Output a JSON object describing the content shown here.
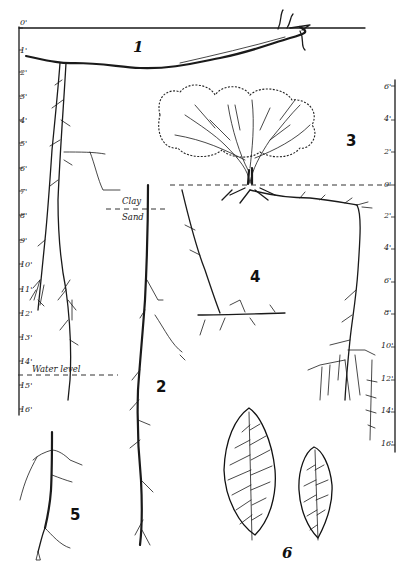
{
  "figure": {
    "type": "botanical root system diagram",
    "panels": [
      {
        "number": "1",
        "label": "1",
        "description": "horizontal root near surface"
      },
      {
        "number": "2",
        "label": "2",
        "description": "vertical taproot extending below water level"
      },
      {
        "number": "3",
        "label": "3",
        "description": "shrub with above-ground crown"
      },
      {
        "number": "4",
        "label": "4",
        "description": "lateral root system beneath shrub"
      },
      {
        "number": "5",
        "label": "5",
        "description": "detached root fragment"
      },
      {
        "number": "6",
        "label": "6",
        "description": "two leaves showing venation"
      }
    ],
    "left_scale": {
      "ticks": [
        "0'",
        "1'",
        "2'",
        "3'",
        "4'",
        "5'",
        "6'",
        "7'",
        "8'",
        "9'",
        "10'",
        "11'",
        "12'",
        "13'",
        "14'",
        "15'",
        "16'"
      ]
    },
    "right_scale": {
      "above_ground_ticks": [
        "6'",
        "4'",
        "2'",
        "0'"
      ],
      "below_ground_ticks": [
        "2'",
        "4'",
        "6'",
        "8'",
        "10'",
        "12'",
        "14'",
        "16'"
      ]
    },
    "annotations": {
      "clay": "Clay",
      "sand": "Sand",
      "water_level": "Water level"
    }
  }
}
